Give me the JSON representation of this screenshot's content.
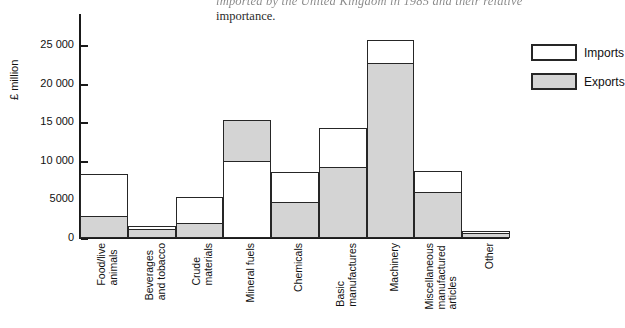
{
  "document_text": {
    "line1": "imported   by   the   United   Kingdom   in   1985   and   their   relative",
    "line1_words": [
      "imported",
      "by",
      "the",
      "United",
      "Kingdom",
      "in",
      "1985",
      "and",
      "their",
      "relative"
    ],
    "line2": "importance."
  },
  "legend": {
    "position": "right",
    "entries": [
      {
        "label": "Imports",
        "swatch": "white-box-icon",
        "color": "#ffffff"
      },
      {
        "label": "Exports",
        "swatch": "grey-box-icon",
        "color": "#d4d4d4"
      }
    ]
  },
  "chart_data": {
    "type": "bar",
    "title": "",
    "subtitle": "",
    "xlabel": "",
    "ylabel": "£ million",
    "ylim": [
      0,
      29000
    ],
    "yticks": [
      0,
      5000,
      10000,
      15000,
      20000,
      25000
    ],
    "ytick_labels": [
      "0",
      "5000",
      "10 000",
      "15 000",
      "20 000",
      "25 000"
    ],
    "grid": false,
    "stacked_overlay": true,
    "categories": [
      "Food/live animals",
      "Beverages and tobacco",
      "Crude materials",
      "Mineral fuels",
      "Chemicals",
      "Basic manufactures",
      "Machinery",
      "Miscellaneous manufactured articles",
      "Other"
    ],
    "category_lines": [
      [
        "Food/live",
        "animals"
      ],
      [
        "Beverages",
        "and tobacco"
      ],
      [
        "Crude",
        "materials"
      ],
      [
        "Mineral fuels"
      ],
      [
        "Chemicals"
      ],
      [
        "Basic",
        "manufactures"
      ],
      [
        "Machinery"
      ],
      [
        "Miscellaneous",
        "manufactured",
        "articles"
      ],
      [
        "Other"
      ]
    ],
    "series": [
      {
        "name": "Imports",
        "color": "#ffffff",
        "values": [
          8300,
          1500,
          5300,
          10000,
          8500,
          14300,
          25700,
          8700,
          900
        ]
      },
      {
        "name": "Exports",
        "color": "#d4d4d4",
        "values": [
          2900,
          1200,
          2000,
          15300,
          4600,
          9200,
          22700,
          5900,
          700
        ]
      }
    ]
  }
}
